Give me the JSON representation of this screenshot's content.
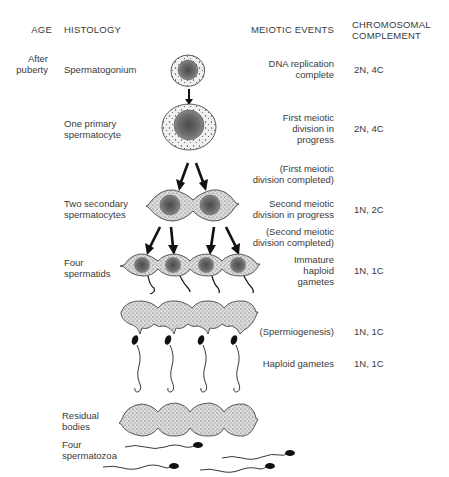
{
  "headers": {
    "age": "AGE",
    "histology": "HISTOLOGY",
    "meiotic_events": "MEIOTIC EVENTS",
    "chromosomal_line1": "CHROMOSOMAL",
    "chromosomal_line2": "COMPLEMENT"
  },
  "age": {
    "line1": "After",
    "line2": "puberty"
  },
  "stages": [
    {
      "histology": [
        "Spermatogonium"
      ],
      "meiotic": [
        "DNA replication",
        "complete"
      ],
      "complement": "2N, 4C"
    },
    {
      "histology": [
        "One primary",
        "spermatocyte"
      ],
      "meiotic": [
        "First meiotic",
        "division in",
        "progress"
      ],
      "complement": "2N, 4C"
    },
    {
      "histology": [],
      "meiotic": [
        "(First meiotic",
        "division completed)"
      ],
      "complement": ""
    },
    {
      "histology": [
        "Two secondary",
        "spermatocytes"
      ],
      "meiotic": [
        "Second meiotic",
        "division in progress"
      ],
      "complement": "1N, 2C"
    },
    {
      "histology": [],
      "meiotic": [
        "(Second meiotic",
        "division completed)"
      ],
      "complement": ""
    },
    {
      "histology": [
        "Four",
        "spermatids"
      ],
      "meiotic": [
        "Immature",
        "haploid",
        "gametes"
      ],
      "complement": "1N, 1C"
    },
    {
      "histology": [],
      "meiotic": [
        "(Spermiogenesis)"
      ],
      "complement": "1N, 1C"
    },
    {
      "histology": [],
      "meiotic": [
        "Haploid gametes"
      ],
      "complement": "1N, 1C"
    },
    {
      "histology": [
        "Residual",
        "bodies"
      ],
      "meiotic": [],
      "complement": ""
    },
    {
      "histology": [
        "Four",
        "spermatozoa"
      ],
      "meiotic": [],
      "complement": ""
    }
  ],
  "colors": {
    "text": "#3a3a3a",
    "cytoplasm": "#d6d6d6",
    "nucleus": "#6a6a6a",
    "outline": "#2a2a2a",
    "arrow": "#111111"
  }
}
